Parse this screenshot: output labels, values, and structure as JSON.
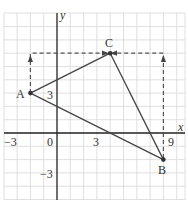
{
  "diagram": {
    "type": "coordinate-grid-triangle",
    "axes": {
      "x_label": "x",
      "y_label": "y",
      "x_ticks": [
        "-3",
        "0",
        "3",
        "9"
      ],
      "y_ticks": [
        "3",
        "-3"
      ],
      "x_range": [
        -4,
        10
      ],
      "y_range": [
        -5,
        9
      ],
      "unit": 1
    },
    "points": [
      {
        "name": "A",
        "x": -2,
        "y": 3
      },
      {
        "name": "B",
        "x": 8,
        "y": -2
      },
      {
        "name": "C",
        "x": 4,
        "y": 6
      }
    ],
    "segments": [
      {
        "from": "A",
        "to": "C",
        "style": "solid"
      },
      {
        "from": "C",
        "to": "B",
        "style": "solid"
      },
      {
        "from": "A",
        "to": "B",
        "style": "solid"
      }
    ],
    "dashed_paths": [
      {
        "from": "A",
        "via": [
          -2,
          6
        ],
        "to": "C",
        "arrows": true
      },
      {
        "from": "B",
        "via": [
          8,
          6
        ],
        "to": "C",
        "arrows": true
      }
    ],
    "labels": {
      "A": "A",
      "B": "B",
      "C": "C",
      "x": "x",
      "y": "y",
      "tick_minus3_x": "−3",
      "tick_0": "0",
      "tick_3_x": "3",
      "tick_9_x": "9",
      "tick_3_y": "3",
      "tick_minus3_y": "−3"
    },
    "colors": {
      "grid": "#d8d8d8",
      "axis": "#222222",
      "line": "#444444",
      "dashed": "#555555",
      "text": "#333333"
    }
  }
}
